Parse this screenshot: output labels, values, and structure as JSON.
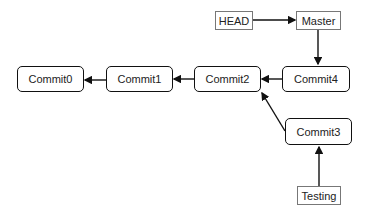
{
  "diagram": {
    "type": "git-commit-graph",
    "refs": [
      {
        "id": "head",
        "label": "HEAD",
        "points_to": "master"
      },
      {
        "id": "master",
        "label": "Master",
        "points_to": "commit4"
      },
      {
        "id": "testing",
        "label": "Testing",
        "points_to": "commit3"
      }
    ],
    "commits": [
      {
        "id": "commit0",
        "label": "Commit0",
        "parent": null
      },
      {
        "id": "commit1",
        "label": "Commit1",
        "parent": "commit0"
      },
      {
        "id": "commit2",
        "label": "Commit2",
        "parent": "commit1"
      },
      {
        "id": "commit4",
        "label": "Commit4",
        "parent": "commit2"
      },
      {
        "id": "commit3",
        "label": "Commit3",
        "parent": "commit2"
      }
    ],
    "colors": {
      "line": "#111111",
      "ref_border": "#777777",
      "text": "#222222"
    }
  }
}
